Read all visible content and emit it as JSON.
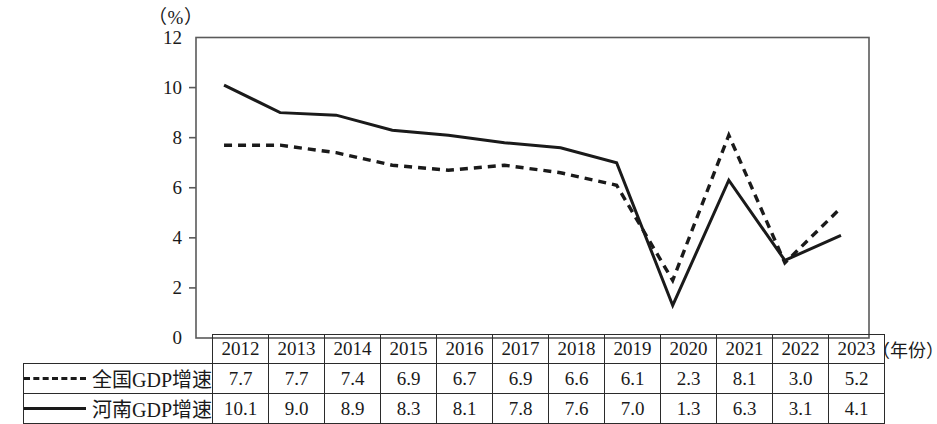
{
  "chart_data": {
    "type": "line",
    "title": "",
    "unit_label": "（%）",
    "xlabel": "（年份）",
    "ylabel": "",
    "categories": [
      "2012",
      "2013",
      "2014",
      "2015",
      "2016",
      "2017",
      "2018",
      "2019",
      "2020",
      "2021",
      "2022",
      "2023"
    ],
    "series": [
      {
        "name": "全国GDP增速",
        "style": "dashed",
        "color": "#1a1a1a",
        "values": [
          7.7,
          7.7,
          7.4,
          6.9,
          6.7,
          6.9,
          6.6,
          6.1,
          2.3,
          8.1,
          3.0,
          5.2
        ]
      },
      {
        "name": "河南GDP增速",
        "style": "solid",
        "color": "#1a1a1a",
        "values": [
          10.1,
          9.0,
          8.9,
          8.3,
          8.1,
          7.8,
          7.6,
          7.0,
          1.3,
          6.3,
          3.1,
          4.1
        ]
      }
    ],
    "ylim": [
      0,
      12
    ],
    "yticks": [
      0,
      2,
      4,
      6,
      8,
      10,
      12
    ],
    "ytick_labels": [
      "0",
      "2",
      "4",
      "6",
      "8",
      "10",
      "12"
    ],
    "grid": false,
    "legend_position": "table-left"
  },
  "table": {
    "year_header": [
      "2012",
      "2013",
      "2014",
      "2015",
      "2016",
      "2017",
      "2018",
      "2019",
      "2020",
      "2021",
      "2022",
      "2023"
    ],
    "rows": [
      {
        "label": "全国GDP增速",
        "line_style": "dashed",
        "values": [
          "7.7",
          "7.7",
          "7.4",
          "6.9",
          "6.7",
          "6.9",
          "6.6",
          "6.1",
          "2.3",
          "8.1",
          "3.0",
          "5.2"
        ]
      },
      {
        "label": "河南GDP增速",
        "line_style": "solid",
        "values": [
          "10.1",
          "9.0",
          "8.9",
          "8.3",
          "8.1",
          "7.8",
          "7.6",
          "7.0",
          "1.3",
          "6.3",
          "3.1",
          "4.1"
        ]
      }
    ]
  }
}
